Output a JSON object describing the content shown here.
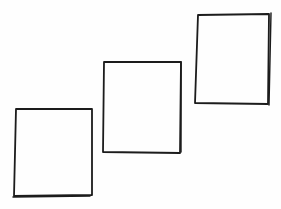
{
  "canvas": {
    "width": 281,
    "height": 209,
    "background": "#fefefe",
    "stroke_color": "#1c1c1c",
    "stroke_width": 1.8
  },
  "shapes": [
    {
      "id": "box-1",
      "label": "",
      "points": [
        [
          16,
          109
        ],
        [
          92,
          109
        ],
        [
          92,
          195
        ],
        [
          14,
          196
        ],
        [
          16,
          109
        ]
      ],
      "extra_strokes": [
        [
          [
            13,
            197
          ],
          [
            90,
            196
          ]
        ]
      ]
    },
    {
      "id": "box-2",
      "label": "",
      "points": [
        [
          104,
          62
        ],
        [
          181,
          62
        ],
        [
          180,
          153
        ],
        [
          103,
          152
        ],
        [
          104,
          62
        ]
      ],
      "extra_strokes": [
        [
          [
            181,
            62
          ],
          [
            181,
            152
          ]
        ]
      ]
    },
    {
      "id": "box-3",
      "label": "",
      "points": [
        [
          198,
          15
        ],
        [
          269,
          14
        ],
        [
          268,
          104
        ],
        [
          195,
          103
        ],
        [
          198,
          15
        ]
      ],
      "extra_strokes": [
        [
          [
            271,
            13
          ],
          [
            269,
            105
          ]
        ]
      ]
    }
  ]
}
